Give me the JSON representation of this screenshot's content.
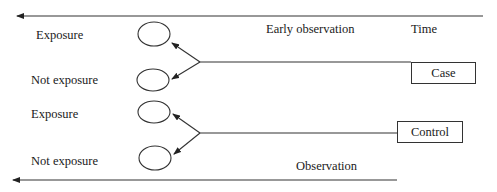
{
  "diagram": {
    "title": "",
    "labels": {
      "exposure_top": "Exposure",
      "not_exposure_top": "Not exposure",
      "exposure_bottom": "Exposure",
      "not_exposure_bottom": "Not exposure",
      "early_observation": "Early observation",
      "time": "Time",
      "observation": "Observation"
    },
    "nodes": {
      "case": "Case",
      "control": "Control"
    },
    "colors": {
      "stroke": "#333333",
      "text": "#1a1a1a",
      "background": "#ffffff"
    }
  }
}
